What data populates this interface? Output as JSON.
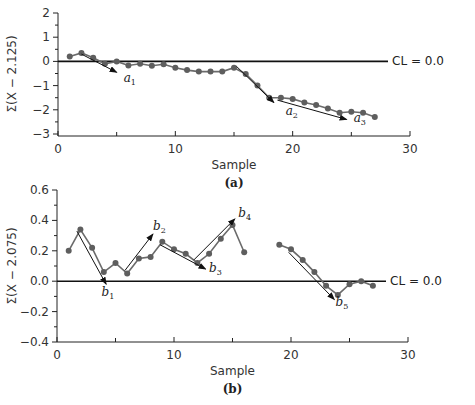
{
  "chart_data": [
    {
      "panel": "(a)",
      "type": "line",
      "title": "",
      "xlabel": "Sample",
      "ylabel": "Σ(X − 2.125)",
      "xlim": [
        0,
        30
      ],
      "ylim": [
        -3,
        2
      ],
      "xticks": [
        0,
        10,
        20,
        30
      ],
      "yticks": [
        2,
        1,
        0,
        -1,
        -2,
        -3
      ],
      "ytick_labels": [
        "2",
        "1",
        "0",
        "−1",
        "−2",
        "−3"
      ],
      "center_line": {
        "value": 0.0,
        "label": "CL = 0.0"
      },
      "grid": false,
      "series": [
        {
          "name": "CUSUM",
          "x": [
            1,
            2,
            3,
            4,
            5,
            6,
            7,
            8,
            9,
            10,
            11,
            12,
            13,
            14,
            15,
            16,
            17,
            18,
            19,
            20,
            21,
            22,
            23,
            24,
            25,
            26,
            27
          ],
          "values": [
            0.2,
            0.35,
            0.15,
            -0.1,
            0.0,
            -0.17,
            -0.1,
            -0.18,
            -0.12,
            -0.26,
            -0.36,
            -0.42,
            -0.42,
            -0.42,
            -0.26,
            -0.52,
            -1.0,
            -1.5,
            -1.5,
            -1.55,
            -1.7,
            -1.8,
            -1.95,
            -2.12,
            -2.08,
            -2.12,
            -2.3
          ]
        }
      ],
      "annotations": [
        {
          "label": "a",
          "sub": "1",
          "from": [
            2,
            0.3
          ],
          "to": [
            5,
            -0.45
          ],
          "text_at": [
            5.6,
            -0.85
          ]
        },
        {
          "label": "a",
          "sub": "2",
          "from": [
            15.2,
            -0.2
          ],
          "to": [
            18.4,
            -1.7
          ],
          "text_at": [
            19.4,
            -2.2
          ]
        },
        {
          "label": "a",
          "sub": "3",
          "from": [
            18.7,
            -1.6
          ],
          "to": [
            24.6,
            -2.4
          ],
          "text_at": [
            25.2,
            -2.5
          ]
        }
      ]
    },
    {
      "panel": "(b)",
      "type": "line",
      "title": "",
      "xlabel": "Sample",
      "ylabel": "Σ(X − 2.075)",
      "xlim": [
        0,
        30
      ],
      "ylim": [
        -0.4,
        0.6
      ],
      "xticks": [
        0,
        10,
        20,
        30
      ],
      "yticks": [
        0.6,
        0.4,
        0.2,
        0.0,
        -0.2,
        -0.4
      ],
      "ytick_labels": [
        "0.6",
        "0.4",
        "0.2",
        "0.0",
        "−0.2",
        "−0.4"
      ],
      "center_line": {
        "value": 0.0,
        "label": "CL = 0.0"
      },
      "grid": false,
      "series": [
        {
          "name": "CUSUM segment 1",
          "x": [
            1,
            2,
            3,
            4,
            5,
            6,
            7,
            8,
            9,
            10,
            11,
            12,
            13,
            14,
            15,
            16
          ],
          "values": [
            0.2,
            0.34,
            0.22,
            0.06,
            0.12,
            0.05,
            0.15,
            0.16,
            0.26,
            0.21,
            0.18,
            0.12,
            0.18,
            0.28,
            0.37,
            0.19
          ]
        },
        {
          "name": "CUSUM segment 2",
          "x": [
            19,
            20,
            21,
            22,
            23,
            24,
            25,
            26,
            27
          ],
          "values": [
            0.24,
            0.21,
            0.14,
            0.06,
            -0.03,
            -0.09,
            -0.02,
            0.0,
            -0.03
          ]
        }
      ],
      "annotations": [
        {
          "label": "b",
          "sub": "1",
          "from": [
            1.7,
            0.33
          ],
          "to": [
            4.2,
            -0.02
          ],
          "text_at": [
            3.8,
            -0.1
          ]
        },
        {
          "label": "b",
          "sub": "2",
          "from": [
            5.8,
            0.07
          ],
          "to": [
            8.2,
            0.31
          ],
          "text_at": [
            8.2,
            0.34
          ]
        },
        {
          "label": "b",
          "sub": "3",
          "from": [
            8.8,
            0.24
          ],
          "to": [
            12.7,
            0.08
          ],
          "text_at": [
            13.0,
            0.06
          ]
        },
        {
          "label": "b",
          "sub": "4",
          "from": [
            11.7,
            0.14
          ],
          "to": [
            15.2,
            0.41
          ],
          "text_at": [
            15.5,
            0.42
          ]
        },
        {
          "label": "b",
          "sub": "5",
          "from": [
            19.8,
            0.19
          ],
          "to": [
            23.7,
            -0.12
          ],
          "text_at": [
            23.8,
            -0.16
          ]
        }
      ]
    }
  ],
  "figure": {
    "panels": [
      {
        "label": "(a)",
        "plot_box": {
          "x0": 58,
          "x1": 410,
          "y_top": 13,
          "y_bottom": 134
        },
        "axis_y": 136,
        "ylabel_x": 16,
        "ylabel_y": 74
      },
      {
        "label": "(b)",
        "plot_box": {
          "x0": 57,
          "x1": 408,
          "y_top": 190,
          "y_bottom": 342
        },
        "axis_y": 342,
        "ylabel_x": 16,
        "ylabel_y": 266
      }
    ],
    "colors": {
      "series": "#6b6b6b",
      "marker": "#5e5e5e",
      "axis": "#222222",
      "center_line": "#111111",
      "arrow": "#111111"
    }
  }
}
